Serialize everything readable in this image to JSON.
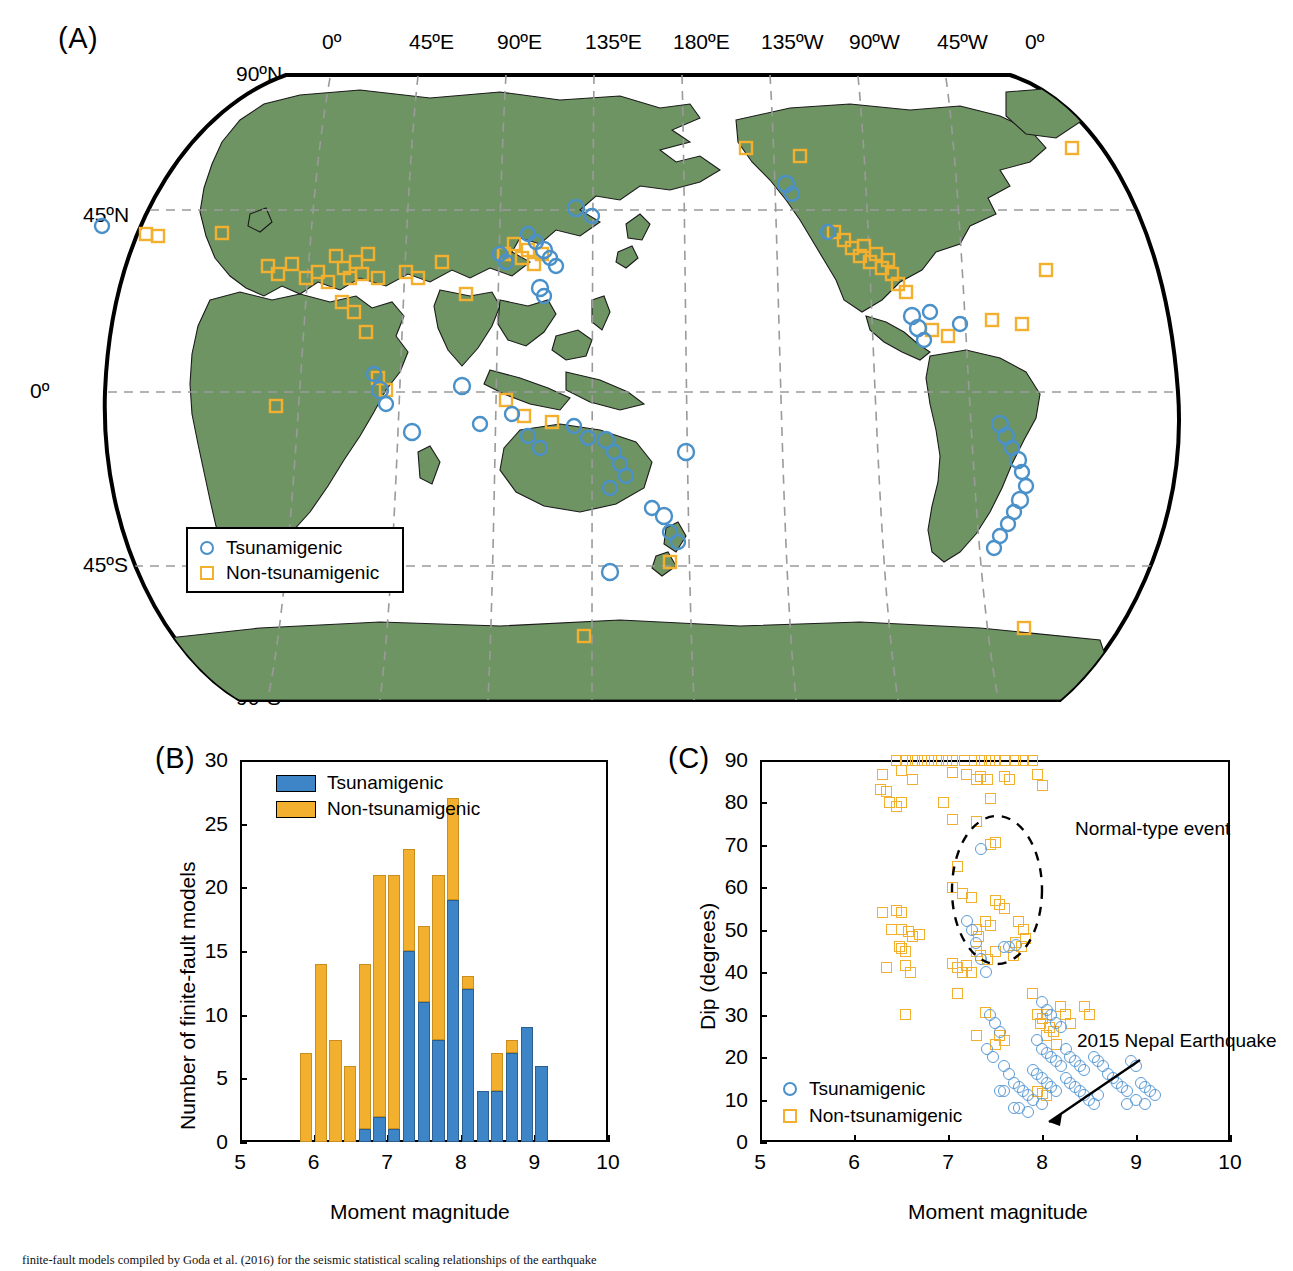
{
  "figure": {
    "panels": [
      {
        "tag": "(A)"
      },
      {
        "tag": "(B)"
      },
      {
        "tag": "(C)"
      }
    ],
    "caption": "finite-fault models compiled by Goda et al. (2016) for the seismic statistical scaling relationships of the earthquake"
  },
  "map": {
    "lon_labels": [
      "0º",
      "45ºE",
      "90ºE",
      "135ºE",
      "180ºE",
      "135ºW",
      "90ºW",
      "45ºW",
      "0º"
    ],
    "lat_labels": [
      "90ºN",
      "45ºN",
      "0º",
      "45ºS",
      "90ºS"
    ],
    "land_color": "#6f9464",
    "legend": [
      {
        "label": "Tsunamigenic",
        "marker": "circle-marker",
        "color": "#4a90c9"
      },
      {
        "label": "Non-tsunamigenic",
        "marker": "square-marker",
        "color": "#f2b02e"
      }
    ]
  },
  "colors": {
    "tsunamigenic": "#3d85c6",
    "non_tsunamigenic": "#f2b02e",
    "land": "#6f9464"
  },
  "chart_data": [
    {
      "type": "bar",
      "panel": "B",
      "title": "",
      "xlabel": "Moment magnitude",
      "ylabel": "Number of finite-fault models",
      "xlim": [
        5,
        10
      ],
      "ylim": [
        0,
        30
      ],
      "xticks": [
        5,
        6,
        7,
        8,
        9,
        10
      ],
      "yticks": [
        0,
        5,
        10,
        15,
        20,
        25,
        30
      ],
      "grid": false,
      "stacked": true,
      "bin_width": 0.2,
      "bin_starts": [
        5.8,
        6.0,
        6.2,
        6.4,
        6.6,
        6.8,
        7.0,
        7.2,
        7.4,
        7.6,
        7.8,
        8.0,
        8.2,
        8.4,
        8.6,
        8.8,
        9.0
      ],
      "legend": [
        "Tsunamigenic",
        "Non-tsunamigenic"
      ],
      "legend_position": "upper-left",
      "series": [
        {
          "name": "Tsunamigenic",
          "values": [
            0,
            0,
            0,
            0,
            1,
            2,
            1,
            15,
            11,
            8,
            19,
            12,
            4,
            4,
            7,
            9,
            6
          ]
        },
        {
          "name": "Non-tsunamigenic",
          "values": [
            7,
            14,
            8,
            6,
            13,
            19,
            20,
            8,
            6,
            13,
            8,
            1,
            0,
            3,
            1,
            0,
            0
          ]
        }
      ],
      "totals": [
        7,
        14,
        8,
        6,
        14,
        21,
        21,
        23,
        17,
        21,
        27,
        13,
        4,
        7,
        8,
        9,
        6
      ]
    },
    {
      "type": "scatter",
      "panel": "C",
      "title": "",
      "xlabel": "Moment magnitude",
      "ylabel": "Dip (degrees)",
      "xlim": [
        5,
        10
      ],
      "ylim": [
        0,
        90
      ],
      "xticks": [
        5,
        6,
        7,
        8,
        9,
        10
      ],
      "yticks": [
        0,
        10,
        20,
        30,
        40,
        50,
        60,
        70,
        80,
        90
      ],
      "grid": false,
      "legend": [
        "Tsunamigenic",
        "Non-tsunamigenic"
      ],
      "legend_position": "lower-left",
      "annotations": [
        {
          "text": "Normal-type event",
          "type": "ellipse-callout"
        },
        {
          "text": "2015 Nepal Earthquake",
          "type": "arrow-callout"
        }
      ],
      "series": [
        {
          "name": "Non-tsunamigenic",
          "marker": "square",
          "points": [
            [
              6.45,
              90
            ],
            [
              6.55,
              90
            ],
            [
              6.62,
              90
            ],
            [
              6.68,
              90
            ],
            [
              6.75,
              90
            ],
            [
              6.82,
              90
            ],
            [
              6.9,
              90
            ],
            [
              6.98,
              90
            ],
            [
              7.05,
              90
            ],
            [
              7.18,
              90
            ],
            [
              7.28,
              90
            ],
            [
              7.36,
              90
            ],
            [
              7.44,
              90
            ],
            [
              7.5,
              90
            ],
            [
              7.6,
              90
            ],
            [
              7.72,
              90
            ],
            [
              7.8,
              90
            ],
            [
              7.9,
              90
            ],
            [
              6.3,
              86.5
            ],
            [
              6.5,
              87.5
            ],
            [
              6.62,
              85.5
            ],
            [
              7.05,
              87
            ],
            [
              7.2,
              86.5
            ],
            [
              7.3,
              85.5
            ],
            [
              7.35,
              86
            ],
            [
              7.42,
              85.5
            ],
            [
              6.28,
              83
            ],
            [
              6.35,
              82.5
            ],
            [
              6.38,
              80
            ],
            [
              6.45,
              79
            ],
            [
              6.5,
              80
            ],
            [
              6.95,
              80
            ],
            [
              7.45,
              81
            ],
            [
              7.05,
              76
            ],
            [
              7.3,
              75.5
            ],
            [
              7.45,
              70
            ],
            [
              7.5,
              70.5
            ],
            [
              7.1,
              65
            ],
            [
              7.05,
              60
            ],
            [
              7.15,
              58.5
            ],
            [
              7.25,
              57.5
            ],
            [
              6.3,
              54
            ],
            [
              6.45,
              54.5
            ],
            [
              6.5,
              54
            ],
            [
              7.5,
              57
            ],
            [
              7.55,
              56
            ],
            [
              7.6,
              55
            ],
            [
              6.4,
              50
            ],
            [
              6.5,
              50
            ],
            [
              6.58,
              49.5
            ],
            [
              6.62,
              48.5
            ],
            [
              6.7,
              49
            ],
            [
              7.3,
              50
            ],
            [
              7.32,
              48.5
            ],
            [
              7.4,
              52
            ],
            [
              7.45,
              51
            ],
            [
              6.48,
              46
            ],
            [
              6.5,
              45.5
            ],
            [
              6.55,
              45
            ],
            [
              7.3,
              45
            ],
            [
              7.35,
              44
            ],
            [
              7.42,
              43
            ],
            [
              7.5,
              45
            ],
            [
              6.35,
              41
            ],
            [
              6.55,
              41.5
            ],
            [
              6.6,
              40
            ],
            [
              7.05,
              42
            ],
            [
              7.1,
              41
            ],
            [
              7.15,
              40
            ],
            [
              7.2,
              41.5
            ],
            [
              7.25,
              40
            ],
            [
              7.6,
              86
            ],
            [
              7.65,
              85.5
            ],
            [
              7.95,
              86.5
            ],
            [
              8.0,
              84
            ],
            [
              7.1,
              35
            ],
            [
              7.4,
              30.5
            ],
            [
              6.55,
              30
            ],
            [
              7.3,
              25
            ],
            [
              7.55,
              25
            ],
            [
              7.9,
              35
            ],
            [
              7.75,
              52
            ],
            [
              7.8,
              50
            ],
            [
              7.72,
              47
            ],
            [
              7.78,
              46
            ],
            [
              7.82,
              48
            ],
            [
              7.7,
              44
            ],
            [
              7.95,
              30
            ],
            [
              8.0,
              29
            ],
            [
              7.98,
              28
            ],
            [
              8.05,
              30
            ],
            [
              8.08,
              27
            ],
            [
              8.12,
              26
            ],
            [
              8.2,
              32
            ],
            [
              8.25,
              30
            ],
            [
              8.3,
              28
            ],
            [
              8.05,
              25
            ],
            [
              8.15,
              23
            ],
            [
              7.6,
              24
            ],
            [
              7.95,
              12
            ],
            [
              8.0,
              11.5
            ],
            [
              8.05,
              11
            ],
            [
              7.5,
              23
            ],
            [
              8.45,
              32
            ],
            [
              8.5,
              30
            ]
          ]
        },
        {
          "name": "Tsunamigenic",
          "marker": "circle",
          "points": [
            [
              7.35,
              69
            ],
            [
              7.6,
              46
            ],
            [
              7.65,
              46
            ],
            [
              7.72,
              46.5
            ],
            [
              7.2,
              52
            ],
            [
              7.25,
              50
            ],
            [
              7.3,
              47
            ],
            [
              7.35,
              43
            ],
            [
              7.4,
              40
            ],
            [
              7.45,
              30
            ],
            [
              7.5,
              28
            ],
            [
              7.55,
              26
            ],
            [
              7.42,
              22
            ],
            [
              7.48,
              20
            ],
            [
              7.6,
              18
            ],
            [
              7.65,
              16
            ],
            [
              7.7,
              14
            ],
            [
              7.75,
              13
            ],
            [
              7.8,
              12
            ],
            [
              8.0,
              33
            ],
            [
              8.05,
              31
            ],
            [
              8.1,
              30
            ],
            [
              8.15,
              28
            ],
            [
              8.2,
              27
            ],
            [
              7.95,
              24
            ],
            [
              8.0,
              22
            ],
            [
              8.05,
              21
            ],
            [
              8.1,
              20
            ],
            [
              8.15,
              19
            ],
            [
              8.2,
              18
            ],
            [
              7.9,
              17
            ],
            [
              7.95,
              16
            ],
            [
              8.0,
              15
            ],
            [
              8.05,
              14
            ],
            [
              8.1,
              13
            ],
            [
              8.15,
              12
            ],
            [
              8.25,
              22
            ],
            [
              8.3,
              20
            ],
            [
              8.35,
              19
            ],
            [
              8.4,
              18
            ],
            [
              8.45,
              17
            ],
            [
              8.25,
              15
            ],
            [
              8.3,
              14
            ],
            [
              8.35,
              13
            ],
            [
              8.4,
              12
            ],
            [
              8.45,
              11
            ],
            [
              8.55,
              20
            ],
            [
              8.6,
              19
            ],
            [
              8.65,
              18
            ],
            [
              8.7,
              16
            ],
            [
              8.75,
              15
            ],
            [
              8.8,
              14
            ],
            [
              8.85,
              13
            ],
            [
              8.9,
              12
            ],
            [
              8.95,
              19
            ],
            [
              9.0,
              18
            ],
            [
              9.05,
              14
            ],
            [
              9.1,
              13
            ],
            [
              9.15,
              12
            ],
            [
              9.2,
              11
            ],
            [
              9.1,
              9
            ],
            [
              7.55,
              12
            ],
            [
              7.6,
              12
            ],
            [
              7.85,
              11
            ],
            [
              7.9,
              10
            ],
            [
              7.7,
              8
            ],
            [
              7.75,
              8
            ],
            [
              7.85,
              7
            ],
            [
              8.0,
              9
            ],
            [
              8.5,
              10
            ],
            [
              8.55,
              9
            ],
            [
              8.6,
              11
            ],
            [
              8.9,
              9
            ],
            [
              9.0,
              10
            ]
          ]
        }
      ]
    }
  ]
}
